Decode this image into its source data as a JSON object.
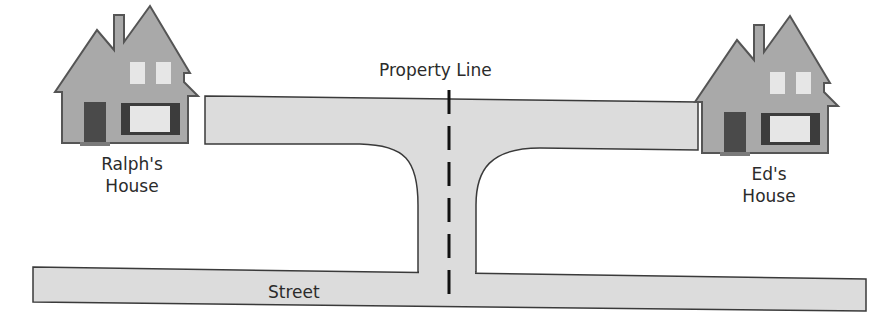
{
  "diagram": {
    "labels": {
      "property_line": "Property Line",
      "street": "Street",
      "ralph_house_line1": "Ralph's",
      "ralph_house_line2": "House",
      "ed_house_line1": "Ed's",
      "ed_house_line2": "House"
    },
    "elements": [
      {
        "id": "ralph-house",
        "type": "house-icon",
        "label": "Ralph's House",
        "position": "left"
      },
      {
        "id": "ed-house",
        "type": "house-icon",
        "label": "Ed's House",
        "position": "right"
      },
      {
        "id": "shared-driveway",
        "type": "driveway",
        "shape": "T",
        "connects": [
          "ralph-house",
          "ed-house",
          "street"
        ]
      },
      {
        "id": "street",
        "type": "road",
        "label": "Street",
        "position": "bottom"
      },
      {
        "id": "property-line",
        "type": "dashed-line",
        "label": "Property Line",
        "orientation": "vertical",
        "divides": "shared-driveway"
      }
    ],
    "colors": {
      "pavement": "#dcdcdc",
      "outline": "#3a3a3a",
      "house_body": "#a9a9a9",
      "house_outline": "#555555",
      "door": "#4a4a4a",
      "window_light": "#e6e6e6",
      "window_frame": "#3c3c3c",
      "property_line": "#111111",
      "text": "#2b2b2b"
    }
  }
}
